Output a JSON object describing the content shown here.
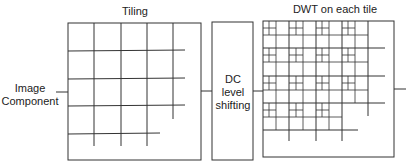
{
  "diagram": {
    "input_label_line1": "Image",
    "input_label_line2": "Component",
    "tiling_title": "Tiling",
    "dc_line1": "DC",
    "dc_line2": "level",
    "dc_line3": "shifting",
    "dwt_title": "DWT on each tile",
    "stroke_color": "#333333"
  }
}
